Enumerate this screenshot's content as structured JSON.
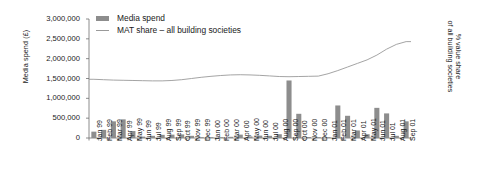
{
  "chart_data": {
    "type": "bar",
    "title": "",
    "subtitle": "",
    "xlabel": "",
    "ylabel": "Media spend (£)",
    "y2label_lines": [
      "% value share",
      "of all building societies"
    ],
    "ylim": [
      0,
      3000000
    ],
    "y_ticks": [
      0,
      500000,
      1000000,
      1500000,
      2000000,
      2500000,
      3000000
    ],
    "y_tick_labels": [
      "0",
      "500,000",
      "1,000,000",
      "1,500,000",
      "2,000,000",
      "2,500,000",
      "3,000,000"
    ],
    "grid": false,
    "legend_position": "top-left",
    "bar_color": "#8d8d8d",
    "line_color": "#9a9a9a",
    "axis_color": "#6e6e6e",
    "categories": [
      "Jan 99",
      "Feb 99",
      "Mar 99",
      "Apr 99",
      "May 99",
      "Jun 99",
      "Jul 99",
      "Aug 99",
      "Sep 99",
      "Oct 99",
      "Nov 99",
      "Dec 99",
      "Jan 00",
      "Feb 00",
      "Mar 00",
      "Apr 00",
      "May 00",
      "Jun 00",
      "Jul 00",
      "Aug 00",
      "Sep 00",
      "Oct 00",
      "Nov 00",
      "Dec 00",
      "Jan 01",
      "Feb 01",
      "Mar 01",
      "Apr 01",
      "May 01",
      "Jun 01",
      "Jul 01",
      "Aug 01",
      "Sep 01"
    ],
    "series": [
      {
        "name": "Media spend",
        "type": "bar",
        "axis": "left",
        "values": [
          160000,
          205000,
          420000,
          470000,
          175000,
          35000,
          55000,
          80000,
          85000,
          90000,
          55000,
          20000,
          15000,
          20000,
          30000,
          85000,
          40000,
          60000,
          55000,
          95000,
          1450000,
          610000,
          25000,
          10000,
          15000,
          820000,
          560000,
          190000,
          95000,
          760000,
          620000,
          55000,
          420000
        ]
      },
      {
        "name": "MAT share – all building societies",
        "type": "line",
        "axis": "left-scaled",
        "values": [
          1480000,
          1470000,
          1460000,
          1455000,
          1450000,
          1445000,
          1440000,
          1440000,
          1450000,
          1470000,
          1500000,
          1530000,
          1555000,
          1575000,
          1590000,
          1595000,
          1590000,
          1580000,
          1565000,
          1550000,
          1545000,
          1550000,
          1555000,
          1560000,
          1620000,
          1700000,
          1790000,
          1880000,
          1970000,
          2090000,
          2240000,
          2360000,
          2430000
        ]
      }
    ]
  },
  "legend": {
    "items": [
      {
        "label": "Media spend",
        "marker": "bar-swatch"
      },
      {
        "label": "MAT share – all building societies",
        "marker": "line-swatch"
      }
    ]
  }
}
